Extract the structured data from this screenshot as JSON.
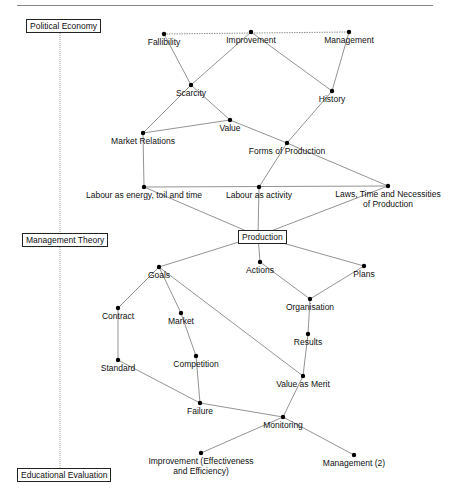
{
  "diagram": {
    "title_rule": true,
    "categories": [
      {
        "id": "political_economy",
        "label": "Political Economy",
        "x": 26,
        "y": 19
      },
      {
        "id": "management_theory",
        "label": "Management Theory",
        "x": 22,
        "y": 233
      },
      {
        "id": "educational_evaluation",
        "label": "Educational Evaluation",
        "x": 17,
        "y": 468
      }
    ],
    "axis": {
      "x": 60,
      "y1": 31,
      "y2": 468,
      "style": "dotted"
    },
    "central_node": {
      "id": "production",
      "label": "Production",
      "x": 258,
      "y": 236
    },
    "nodes": [
      {
        "id": "fallibility",
        "label": "Fallibility",
        "x": 164,
        "y": 34
      },
      {
        "id": "improvement",
        "label": "Improvement",
        "x": 251,
        "y": 32
      },
      {
        "id": "management",
        "label": "Management",
        "x": 349,
        "y": 32
      },
      {
        "id": "scarcity",
        "label": "Scarcity",
        "x": 191,
        "y": 85
      },
      {
        "id": "history",
        "label": "History",
        "x": 332,
        "y": 91
      },
      {
        "id": "value",
        "label": "Value",
        "x": 230,
        "y": 120
      },
      {
        "id": "market_relations",
        "label": "Market Relations",
        "x": 143,
        "y": 133
      },
      {
        "id": "forms_of_production",
        "label": "Forms of Production",
        "x": 287,
        "y": 143
      },
      {
        "id": "labour_energy",
        "label": "Labour as energy, toil and time",
        "x": 144,
        "y": 187
      },
      {
        "id": "labour_activity",
        "label": "Labour as activity",
        "x": 259,
        "y": 187
      },
      {
        "id": "laws_time",
        "label": "Laws, Time and Necessities of Production",
        "x": 388,
        "y": 186
      },
      {
        "id": "goals",
        "label": "Goals",
        "x": 159,
        "y": 267
      },
      {
        "id": "actions",
        "label": "Actions",
        "x": 260,
        "y": 262
      },
      {
        "id": "plans",
        "label": "Plans",
        "x": 364,
        "y": 266
      },
      {
        "id": "contract",
        "label": "Contract",
        "x": 118,
        "y": 308
      },
      {
        "id": "market",
        "label": "Market",
        "x": 181,
        "y": 313
      },
      {
        "id": "organisation",
        "label": "Organisation",
        "x": 310,
        "y": 299
      },
      {
        "id": "results",
        "label": "Results",
        "x": 308,
        "y": 334
      },
      {
        "id": "standard",
        "label": "Standard",
        "x": 118,
        "y": 360
      },
      {
        "id": "competition",
        "label": "Competition",
        "x": 196,
        "y": 356
      },
      {
        "id": "value_as_merit",
        "label": "Value as Merit",
        "x": 303,
        "y": 376
      },
      {
        "id": "failure",
        "label": "Failure",
        "x": 200,
        "y": 403
      },
      {
        "id": "monitoring",
        "label": "Monitoring",
        "x": 283,
        "y": 417
      },
      {
        "id": "improvement_eff",
        "label": "Improvement (Effectiveness and Efficiency)",
        "x": 201,
        "y": 453
      },
      {
        "id": "management_2",
        "label": "Management (2)",
        "x": 354,
        "y": 455
      }
    ],
    "edges": [
      [
        "fallibility",
        "management",
        "dotted"
      ],
      [
        "fallibility",
        "scarcity"
      ],
      [
        "improvement",
        "scarcity"
      ],
      [
        "improvement",
        "history"
      ],
      [
        "management",
        "history"
      ],
      [
        "scarcity",
        "market_relations"
      ],
      [
        "scarcity",
        "value"
      ],
      [
        "value",
        "market_relations"
      ],
      [
        "value",
        "forms_of_production"
      ],
      [
        "history",
        "forms_of_production"
      ],
      [
        "market_relations",
        "labour_energy"
      ],
      [
        "forms_of_production",
        "labour_activity"
      ],
      [
        "forms_of_production",
        "laws_time"
      ],
      [
        "labour_energy",
        "laws_time"
      ],
      [
        "labour_energy",
        "production"
      ],
      [
        "labour_activity",
        "production"
      ],
      [
        "laws_time",
        "production"
      ],
      [
        "production",
        "goals"
      ],
      [
        "production",
        "actions"
      ],
      [
        "production",
        "plans"
      ],
      [
        "goals",
        "contract"
      ],
      [
        "goals",
        "market"
      ],
      [
        "goals",
        "value_as_merit"
      ],
      [
        "actions",
        "organisation"
      ],
      [
        "plans",
        "organisation"
      ],
      [
        "organisation",
        "results"
      ],
      [
        "results",
        "value_as_merit"
      ],
      [
        "contract",
        "standard"
      ],
      [
        "market",
        "competition"
      ],
      [
        "competition",
        "failure"
      ],
      [
        "standard",
        "failure"
      ],
      [
        "failure",
        "monitoring"
      ],
      [
        "value_as_merit",
        "monitoring"
      ],
      [
        "monitoring",
        "improvement_eff"
      ],
      [
        "monitoring",
        "management_2"
      ]
    ],
    "colors": {
      "line": "#777777",
      "node": "#000000",
      "text": "#111111",
      "box_border": "#222222"
    }
  }
}
